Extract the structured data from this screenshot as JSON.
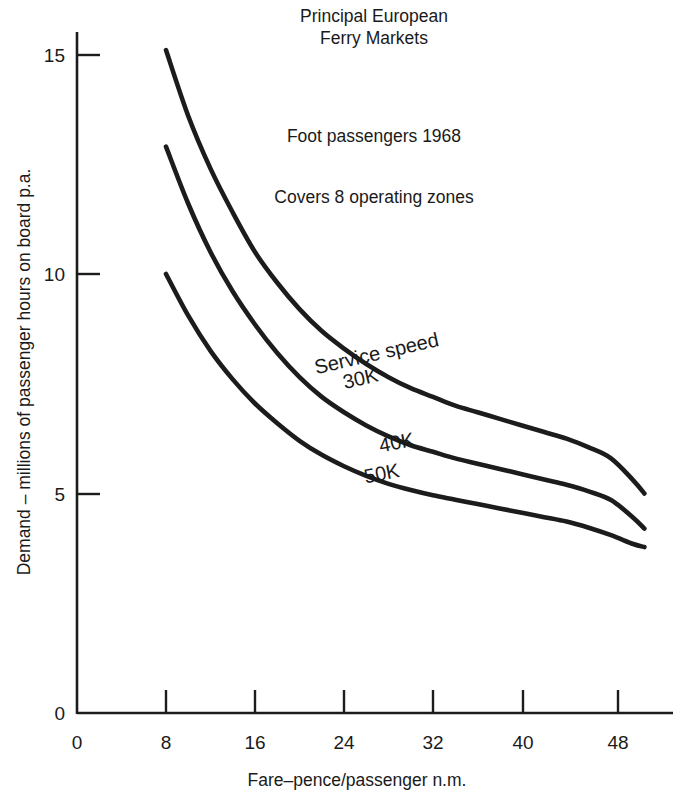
{
  "chart_data": {
    "type": "line",
    "title": "Principal European Ferry Markets",
    "title_line1": "Principal European",
    "title_line2": "Ferry Markets",
    "subtitle": "Foot passengers 1968",
    "note": "Covers 8 operating zones",
    "xlabel": "Fare–pence/passenger n.m.",
    "ylabel": "Demand – millions of passenger hours on board p.a.",
    "xlim": [
      0,
      55.5
    ],
    "ylim": [
      0,
      16.5
    ],
    "xticks": [
      0,
      8,
      16,
      24,
      32,
      40,
      48
    ],
    "xtick_labels": [
      "0",
      "8",
      "16",
      "24",
      "32",
      "40",
      "48"
    ],
    "yticks": [
      0,
      5,
      10,
      15
    ],
    "ytick_labels": [
      "0",
      "5",
      "10",
      "15"
    ],
    "grid": false,
    "legend": "inline-curve-labels",
    "legend_prefix": "Service speed",
    "series": [
      {
        "name": "30K",
        "label": "30K",
        "x": [
          8,
          10,
          12,
          14,
          16,
          18,
          20,
          22,
          24,
          26,
          28,
          30,
          32,
          34,
          36,
          38,
          40,
          42,
          44,
          46,
          48,
          50,
          51
        ],
        "values": [
          15.1,
          13.6,
          12.4,
          11.4,
          10.5,
          9.8,
          9.2,
          8.7,
          8.3,
          7.95,
          7.65,
          7.4,
          7.2,
          7.0,
          6.85,
          6.7,
          6.55,
          6.4,
          6.25,
          6.05,
          5.8,
          5.3,
          5.0
        ]
      },
      {
        "name": "40K",
        "label": "40K",
        "x": [
          8,
          10,
          12,
          14,
          16,
          18,
          20,
          22,
          24,
          26,
          28,
          30,
          32,
          34,
          36,
          38,
          40,
          42,
          44,
          46,
          48,
          50,
          51
        ],
        "values": [
          12.9,
          11.6,
          10.5,
          9.6,
          8.85,
          8.2,
          7.65,
          7.2,
          6.85,
          6.55,
          6.3,
          6.1,
          5.95,
          5.8,
          5.68,
          5.56,
          5.44,
          5.32,
          5.2,
          5.05,
          4.85,
          4.45,
          4.2
        ]
      },
      {
        "name": "50K",
        "label": "50K",
        "x": [
          8,
          10,
          12,
          14,
          16,
          18,
          20,
          22,
          24,
          26,
          28,
          30,
          32,
          34,
          36,
          38,
          40,
          42,
          44,
          46,
          48,
          50,
          51
        ],
        "values": [
          10.0,
          9.05,
          8.25,
          7.6,
          7.05,
          6.6,
          6.2,
          5.88,
          5.62,
          5.4,
          5.22,
          5.08,
          4.96,
          4.86,
          4.76,
          4.66,
          4.56,
          4.46,
          4.36,
          4.22,
          4.05,
          3.85,
          3.78
        ]
      }
    ]
  },
  "axes": {
    "x_tick_0": "0",
    "x_tick_8": "8",
    "x_tick_16": "16",
    "x_tick_24": "24",
    "x_tick_32": "32",
    "x_tick_40": "40",
    "x_tick_48": "48",
    "y_tick_0": "0",
    "y_tick_5": "5",
    "y_tick_10": "10",
    "y_tick_15": "15",
    "x_axis_title": "Fare–pence/passenger n.m.",
    "y_axis_title": "Demand – millions of passenger hours on board p.a."
  },
  "annotations": {
    "title_line1": "Principal European",
    "title_line2": "Ferry Markets",
    "subtitle": "Foot passengers 1968",
    "note": "Covers 8 operating zones",
    "legend_prefix": "Service speed",
    "label_30k": "30K",
    "label_40k": "40K",
    "label_50k": "50K"
  },
  "colors": {
    "background": "#ffffff",
    "ink": "#1c1c1c",
    "curve": "#1c1c1c"
  }
}
